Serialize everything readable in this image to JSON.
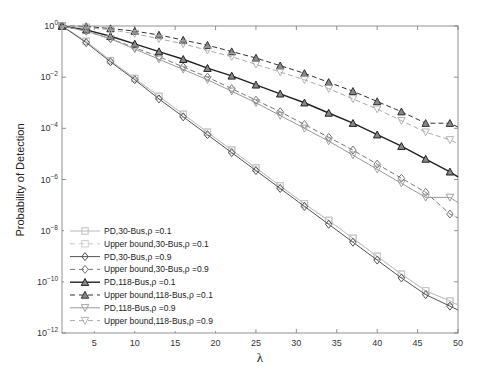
{
  "chart_data": {
    "type": "line",
    "title": "",
    "xlabel": "λ",
    "ylabel": "Probability of Detection",
    "yscale": "log",
    "xlim": [
      1,
      50
    ],
    "ylim_exponent": [
      -12,
      0
    ],
    "xticks": [
      5,
      10,
      15,
      20,
      25,
      30,
      35,
      40,
      45,
      50
    ],
    "yticks": [
      "10^0",
      "10^-2",
      "10^-4",
      "10^-6",
      "10^-8",
      "10^-10",
      "10^-12"
    ],
    "grid": false,
    "legend_position": "lower left",
    "x": [
      1,
      4,
      7,
      10,
      13,
      16,
      19,
      22,
      25,
      28,
      31,
      34,
      37,
      40,
      43,
      46,
      49,
      50
    ],
    "series": [
      {
        "name": "PD,30-Bus,ρ =0.1",
        "style": "solid",
        "marker": "square",
        "color": "#b8b8b8",
        "log10_values": [
          0,
          -0.6,
          -1.35,
          -2.05,
          -2.75,
          -3.45,
          -4.15,
          -4.85,
          -5.55,
          -6.25,
          -6.95,
          -7.6,
          -8.3,
          -9.0,
          -9.7,
          -10.35,
          -10.75,
          -10.9
        ]
      },
      {
        "name": "Upper bound,30-Bus,ρ =0.1",
        "style": "dashed",
        "marker": "square",
        "color": "#c8c8c8",
        "log10_values": [
          0,
          -0.6,
          -1.35,
          -2.05,
          -2.75,
          -3.45,
          -4.15,
          -4.85,
          -5.55,
          -6.25,
          -6.95,
          -7.6,
          -8.3,
          -9.0,
          -9.7,
          -10.35,
          -10.75,
          -10.9
        ]
      },
      {
        "name": "PD,30-Bus,ρ =0.9",
        "style": "solid",
        "marker": "diamond",
        "color": "#555555",
        "log10_values": [
          0,
          -0.65,
          -1.4,
          -2.1,
          -2.85,
          -3.55,
          -4.25,
          -4.95,
          -5.65,
          -6.35,
          -7.05,
          -7.75,
          -8.45,
          -9.15,
          -9.85,
          -10.5,
          -10.95,
          -11.1
        ]
      },
      {
        "name": "Upper bound,30-Bus,ρ =0.9",
        "style": "dashed",
        "marker": "diamond",
        "color": "#777777",
        "log10_values": [
          0,
          -0.2,
          -0.5,
          -0.85,
          -1.2,
          -1.6,
          -2.0,
          -2.45,
          -2.9,
          -3.35,
          -3.85,
          -4.35,
          -4.85,
          -5.4,
          -5.95,
          -6.5,
          -7.35,
          -7.5
        ]
      },
      {
        "name": "PD,118-Bus,ρ =0.1",
        "style": "solid",
        "marker": "triangle-up",
        "color": "#222222",
        "log10_values": [
          0,
          -0.15,
          -0.4,
          -0.7,
          -1.0,
          -1.3,
          -1.65,
          -1.95,
          -2.3,
          -2.65,
          -3.0,
          -3.4,
          -3.8,
          -4.25,
          -4.7,
          -5.2,
          -5.7,
          -5.9
        ]
      },
      {
        "name": "Upper bound,118-Bus,ρ =0.1",
        "style": "dashed",
        "marker": "triangle-up",
        "color": "#333333",
        "log10_values": [
          0,
          -0.02,
          -0.1,
          -0.2,
          -0.35,
          -0.55,
          -0.75,
          -1.0,
          -1.25,
          -1.55,
          -1.85,
          -2.2,
          -2.55,
          -2.95,
          -3.35,
          -3.8,
          -3.8,
          -3.95
        ]
      },
      {
        "name": "PD,118-Bus,ρ =0.9",
        "style": "solid",
        "marker": "triangle-down",
        "color": "#999999",
        "log10_values": [
          0,
          -0.2,
          -0.5,
          -0.9,
          -1.3,
          -1.7,
          -2.1,
          -2.55,
          -3.0,
          -3.5,
          -4.0,
          -4.5,
          -5.05,
          -5.6,
          -6.15,
          -6.7,
          -6.7,
          -6.9
        ]
      },
      {
        "name": "Upper bound,118-Bus,ρ =0.9",
        "style": "dashed",
        "marker": "triangle-down",
        "color": "#aaaaaa",
        "log10_values": [
          0,
          -0.05,
          -0.15,
          -0.3,
          -0.5,
          -0.7,
          -0.95,
          -1.2,
          -1.5,
          -1.8,
          -2.1,
          -2.45,
          -2.85,
          -3.25,
          -3.7,
          -4.15,
          -4.45,
          -4.6
        ]
      }
    ]
  }
}
